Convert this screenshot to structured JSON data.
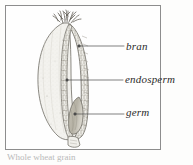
{
  "figure": {
    "kind": "wheat-grain-cross-section-diagram",
    "frame_border_color": "#8d8d8d",
    "background_color": "#fefefe",
    "ink_color": "#585858",
    "labels": [
      {
        "id": "bran",
        "text": "bran"
      },
      {
        "id": "endosperm",
        "text": "endosperm"
      },
      {
        "id": "germ",
        "text": "germ"
      }
    ],
    "parts": [
      {
        "id": "brush",
        "name": "brush-hairs-tuft"
      },
      {
        "id": "bran",
        "name": "bran-layer"
      },
      {
        "id": "endosperm",
        "name": "endosperm-body"
      },
      {
        "id": "germ",
        "name": "germ-embryo"
      },
      {
        "id": "tip",
        "name": "basal-tip"
      }
    ],
    "caption": "Whole wheat grain"
  }
}
